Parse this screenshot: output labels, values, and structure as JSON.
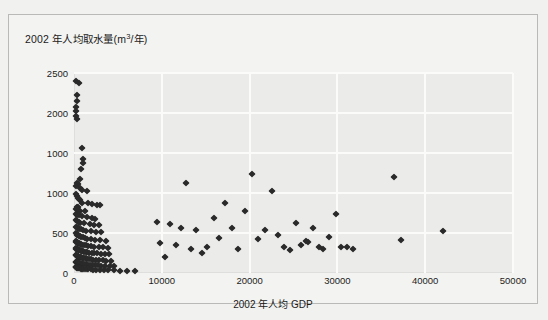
{
  "chart_data": {
    "type": "scatter",
    "title_main": "2002 年人均取水量(m",
    "title_sup": "3",
    "title_tail": "/年)",
    "xlabel": "2002 年人均 GDP",
    "ylabel": "2002 年人均取水量(m³/年)",
    "xlim": [
      0,
      50000
    ],
    "ylim": [
      0,
      2500
    ],
    "xticks": [
      0,
      10000,
      20000,
      30000,
      40000,
      50000
    ],
    "xtick_labels": [
      "0",
      "10000",
      "20000",
      "30000",
      "40000",
      "50000"
    ],
    "yticks": [
      0,
      500,
      1000,
      1500,
      2000,
      2500
    ],
    "ytick_labels": [
      "0",
      "500",
      "1000",
      "1000",
      "2000",
      "2500"
    ],
    "grid": true,
    "legend": null,
    "marker": "diamond",
    "marker_color": "#2a2a2a",
    "plot_bg": "#ebebe9",
    "grid_color": "#fbfbfa",
    "points": [
      [
        250,
        2400
      ],
      [
        600,
        2380
      ],
      [
        300,
        2230
      ],
      [
        350,
        2150
      ],
      [
        250,
        2070
      ],
      [
        230,
        2020
      ],
      [
        260,
        1960
      ],
      [
        330,
        1930
      ],
      [
        900,
        1560
      ],
      [
        1050,
        1430
      ],
      [
        1000,
        1380
      ],
      [
        800,
        1300
      ],
      [
        700,
        1180
      ],
      [
        350,
        1130
      ],
      [
        420,
        1110
      ],
      [
        250,
        1090
      ],
      [
        700,
        1060
      ],
      [
        900,
        1040
      ],
      [
        1500,
        1020
      ],
      [
        260,
        990
      ],
      [
        300,
        960
      ],
      [
        430,
        940
      ],
      [
        520,
        930
      ],
      [
        640,
        910
      ],
      [
        900,
        880
      ],
      [
        1600,
        870
      ],
      [
        2100,
        860
      ],
      [
        2600,
        850
      ],
      [
        3000,
        845
      ],
      [
        350,
        830
      ],
      [
        500,
        820
      ],
      [
        260,
        800
      ],
      [
        420,
        790
      ],
      [
        700,
        780
      ],
      [
        1200,
        770
      ],
      [
        280,
        740
      ],
      [
        350,
        730
      ],
      [
        600,
        720
      ],
      [
        900,
        710
      ],
      [
        1500,
        700
      ],
      [
        2000,
        690
      ],
      [
        2400,
        680
      ],
      [
        260,
        660
      ],
      [
        380,
        650
      ],
      [
        520,
        640
      ],
      [
        700,
        630
      ],
      [
        1100,
        620
      ],
      [
        1800,
        610
      ],
      [
        2300,
        600
      ],
      [
        2900,
        595
      ],
      [
        250,
        580
      ],
      [
        330,
        570
      ],
      [
        450,
        560
      ],
      [
        600,
        555
      ],
      [
        800,
        545
      ],
      [
        1000,
        540
      ],
      [
        1400,
        530
      ],
      [
        1900,
        525
      ],
      [
        2500,
        515
      ],
      [
        3100,
        510
      ],
      [
        240,
        495
      ],
      [
        300,
        490
      ],
      [
        380,
        480
      ],
      [
        470,
        475
      ],
      [
        560,
        465
      ],
      [
        680,
        460
      ],
      [
        820,
        450
      ],
      [
        980,
        445
      ],
      [
        1200,
        440
      ],
      [
        1500,
        430
      ],
      [
        1900,
        425
      ],
      [
        2400,
        415
      ],
      [
        3000,
        410
      ],
      [
        3600,
        405
      ],
      [
        230,
        395
      ],
      [
        280,
        390
      ],
      [
        340,
        385
      ],
      [
        410,
        380
      ],
      [
        490,
        375
      ],
      [
        580,
        370
      ],
      [
        690,
        365
      ],
      [
        820,
        360
      ],
      [
        960,
        355
      ],
      [
        1150,
        350
      ],
      [
        1350,
        345
      ],
      [
        1600,
        340
      ],
      [
        1950,
        335
      ],
      [
        2300,
        330
      ],
      [
        2800,
        325
      ],
      [
        3300,
        320
      ],
      [
        3900,
        318
      ],
      [
        220,
        310
      ],
      [
        260,
        305
      ],
      [
        310,
        300
      ],
      [
        370,
        298
      ],
      [
        430,
        295
      ],
      [
        500,
        290
      ],
      [
        580,
        285
      ],
      [
        670,
        282
      ],
      [
        770,
        278
      ],
      [
        880,
        275
      ],
      [
        1000,
        270
      ],
      [
        1150,
        265
      ],
      [
        1320,
        262
      ],
      [
        1520,
        258
      ],
      [
        1750,
        255
      ],
      [
        2000,
        250
      ],
      [
        2300,
        248
      ],
      [
        2650,
        245
      ],
      [
        3050,
        242
      ],
      [
        3500,
        238
      ],
      [
        4000,
        235
      ],
      [
        210,
        225
      ],
      [
        250,
        220
      ],
      [
        295,
        218
      ],
      [
        345,
        215
      ],
      [
        400,
        212
      ],
      [
        460,
        208
      ],
      [
        530,
        205
      ],
      [
        610,
        202
      ],
      [
        700,
        198
      ],
      [
        800,
        195
      ],
      [
        910,
        192
      ],
      [
        1030,
        188
      ],
      [
        1170,
        185
      ],
      [
        1330,
        182
      ],
      [
        1510,
        178
      ],
      [
        1710,
        175
      ],
      [
        1940,
        172
      ],
      [
        2200,
        168
      ],
      [
        2500,
        165
      ],
      [
        2850,
        162
      ],
      [
        3250,
        158
      ],
      [
        3700,
        155
      ],
      [
        4200,
        152
      ],
      [
        200,
        140
      ],
      [
        240,
        138
      ],
      [
        285,
        135
      ],
      [
        335,
        132
      ],
      [
        390,
        130
      ],
      [
        450,
        127
      ],
      [
        520,
        125
      ],
      [
        600,
        122
      ],
      [
        690,
        120
      ],
      [
        790,
        117
      ],
      [
        900,
        115
      ],
      [
        1030,
        112
      ],
      [
        1180,
        110
      ],
      [
        1350,
        107
      ],
      [
        1550,
        105
      ],
      [
        1780,
        102
      ],
      [
        2050,
        100
      ],
      [
        2350,
        97
      ],
      [
        2700,
        95
      ],
      [
        3100,
        92
      ],
      [
        3550,
        90
      ],
      [
        4050,
        88
      ],
      [
        4600,
        85
      ],
      [
        190,
        75
      ],
      [
        230,
        72
      ],
      [
        275,
        70
      ],
      [
        325,
        68
      ],
      [
        380,
        66
      ],
      [
        445,
        64
      ],
      [
        520,
        62
      ],
      [
        605,
        60
      ],
      [
        700,
        58
      ],
      [
        810,
        56
      ],
      [
        935,
        54
      ],
      [
        1080,
        52
      ],
      [
        1240,
        50
      ],
      [
        1430,
        48
      ],
      [
        1650,
        46
      ],
      [
        1900,
        44
      ],
      [
        2200,
        42
      ],
      [
        2550,
        40
      ],
      [
        2950,
        38
      ],
      [
        3400,
        36
      ],
      [
        3900,
        34
      ],
      [
        4500,
        32
      ],
      [
        5200,
        30
      ],
      [
        6000,
        28
      ],
      [
        7000,
        26
      ],
      [
        9400,
        640
      ],
      [
        9800,
        380
      ],
      [
        10400,
        205
      ],
      [
        10900,
        610
      ],
      [
        11600,
        350
      ],
      [
        12200,
        560
      ],
      [
        12800,
        1120
      ],
      [
        13300,
        300
      ],
      [
        13900,
        540
      ],
      [
        14600,
        250
      ],
      [
        15200,
        320
      ],
      [
        15900,
        690
      ],
      [
        16500,
        440
      ],
      [
        17200,
        880
      ],
      [
        18000,
        560
      ],
      [
        18700,
        300
      ],
      [
        19500,
        780
      ],
      [
        20300,
        1240
      ],
      [
        21000,
        420
      ],
      [
        21800,
        540
      ],
      [
        22600,
        1020
      ],
      [
        23200,
        480
      ],
      [
        23900,
        330
      ],
      [
        24600,
        290
      ],
      [
        25300,
        620
      ],
      [
        25900,
        350
      ],
      [
        26400,
        400
      ],
      [
        26700,
        390
      ],
      [
        27200,
        560
      ],
      [
        27900,
        320
      ],
      [
        28400,
        300
      ],
      [
        29100,
        450
      ],
      [
        29800,
        740
      ],
      [
        30400,
        320
      ],
      [
        31100,
        330
      ],
      [
        31800,
        305
      ],
      [
        36500,
        1200
      ],
      [
        37200,
        410
      ],
      [
        42000,
        530
      ]
    ],
    "n_points": 224
  }
}
